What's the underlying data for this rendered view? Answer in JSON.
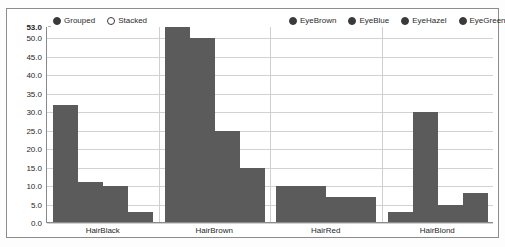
{
  "legend_mode": {
    "items": [
      {
        "label": "Grouped",
        "selected": true
      },
      {
        "label": "Stacked",
        "selected": false
      }
    ]
  },
  "legend_series": {
    "items": [
      {
        "label": "EyeBrown",
        "selected": true
      },
      {
        "label": "EyeBlue",
        "selected": true
      },
      {
        "label": "EyeHazel",
        "selected": true
      },
      {
        "label": "EyeGreen",
        "selected": true
      }
    ]
  },
  "axis": {
    "y_ticks": [
      "53.0",
      "50.0",
      "45.0",
      "40.0",
      "35.0",
      "30.0",
      "25.0",
      "20.0",
      "15.0",
      "10.0",
      "5.0",
      "0.0"
    ],
    "y_tick_values": [
      53.0,
      50.0,
      45.0,
      40.0,
      35.0,
      30.0,
      25.0,
      20.0,
      15.0,
      10.0,
      5.0,
      0.0
    ],
    "x_labels": [
      "HairBlack",
      "HairBrown",
      "HairRed",
      "HairBlond"
    ]
  },
  "colors": {
    "bar": "#5b5b5b",
    "grid": "#d2d2d2",
    "axis": "#8a8a8a",
    "panel_border": "#8c8c8c",
    "text": "#1f1f1f",
    "background": "#ffffff"
  },
  "chart_data": {
    "type": "bar",
    "title": "",
    "xlabel": "",
    "ylabel": "",
    "ylim": [
      0,
      53
    ],
    "grid": true,
    "legend_position": "top",
    "mode": "Grouped",
    "categories": [
      "HairBlack",
      "HairBrown",
      "HairRed",
      "HairBlond"
    ],
    "series": [
      {
        "name": "EyeBrown",
        "values": [
          32,
          53,
          10,
          3
        ]
      },
      {
        "name": "EyeBlue",
        "values": [
          11,
          50,
          10,
          30
        ]
      },
      {
        "name": "EyeHazel",
        "values": [
          10,
          25,
          7,
          5
        ]
      },
      {
        "name": "EyeGreen",
        "values": [
          3,
          15,
          7,
          8
        ]
      }
    ]
  }
}
